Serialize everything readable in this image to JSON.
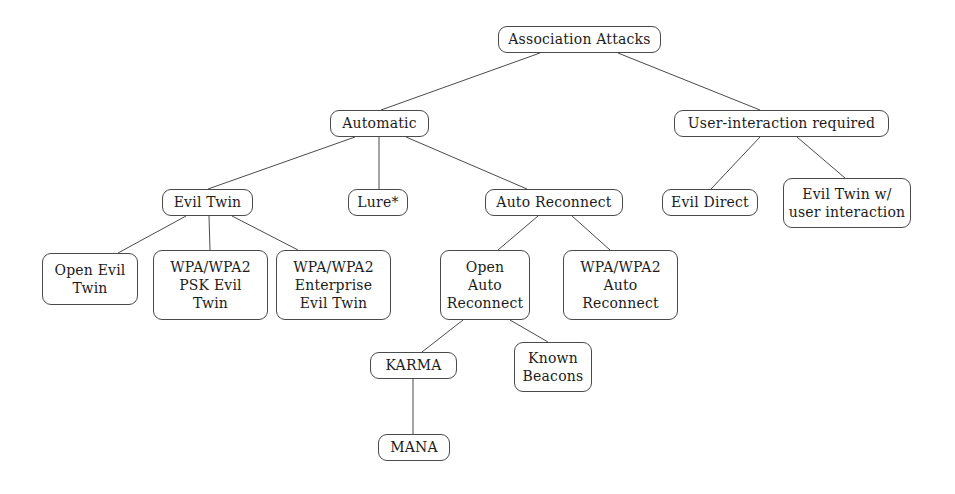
{
  "diagram": {
    "title": "Association Attacks",
    "type": "taxonomy-tree",
    "background_color": "#ffffff",
    "node_border_color": "#4a4a4a",
    "edge_color": "#4a4a4a",
    "text_color": "#1c1c1c",
    "footnote_marker": "*",
    "nodes": [
      {
        "id": "association-attacks",
        "lines": [
          "Association Attacks"
        ],
        "x": 498,
        "y": 26,
        "w": 163,
        "h": 27,
        "level": 0
      },
      {
        "id": "automatic",
        "lines": [
          "Automatic"
        ],
        "x": 330,
        "y": 110,
        "w": 99,
        "h": 27,
        "level": 1
      },
      {
        "id": "user-interaction-required",
        "lines": [
          "User-interaction required"
        ],
        "x": 674,
        "y": 110,
        "w": 215,
        "h": 27,
        "level": 1
      },
      {
        "id": "evil-twin",
        "lines": [
          "Evil Twin"
        ],
        "x": 162,
        "y": 189,
        "w": 91,
        "h": 27,
        "level": 2
      },
      {
        "id": "lure",
        "lines": [
          "Lure*"
        ],
        "x": 348,
        "y": 189,
        "w": 60,
        "h": 27,
        "level": 2
      },
      {
        "id": "auto-reconnect",
        "lines": [
          "Auto Reconnect"
        ],
        "x": 485,
        "y": 189,
        "w": 138,
        "h": 27,
        "level": 2
      },
      {
        "id": "evil-direct",
        "lines": [
          "Evil Direct"
        ],
        "x": 662,
        "y": 189,
        "w": 96,
        "h": 27,
        "level": 2
      },
      {
        "id": "evil-twin-with-user-interaction",
        "lines": [
          "Evil Twin w/",
          "user interaction"
        ],
        "x": 783,
        "y": 178,
        "w": 128,
        "h": 50,
        "level": 2
      },
      {
        "id": "open-evil-twin",
        "lines": [
          "Open Evil",
          "Twin"
        ],
        "x": 42,
        "y": 253,
        "w": 96,
        "h": 52,
        "level": 3
      },
      {
        "id": "wpa-wpa2-psk-evil-twin",
        "lines": [
          "WPA/WPA2",
          "PSK Evil",
          "Twin"
        ],
        "x": 153,
        "y": 250,
        "w": 115,
        "h": 70,
        "level": 3
      },
      {
        "id": "wpa-wpa2-enterprise-evil-twin",
        "lines": [
          "WPA/WPA2",
          "Enterprise",
          "Evil Twin"
        ],
        "x": 276,
        "y": 250,
        "w": 115,
        "h": 70,
        "level": 3
      },
      {
        "id": "open-auto-reconnect",
        "lines": [
          "Open",
          "Auto",
          "Reconnect"
        ],
        "x": 440,
        "y": 250,
        "w": 90,
        "h": 70,
        "level": 3
      },
      {
        "id": "wpa-wpa2-auto-reconnect",
        "lines": [
          "WPA/WPA2",
          "Auto",
          "Reconnect"
        ],
        "x": 563,
        "y": 250,
        "w": 115,
        "h": 70,
        "level": 3
      },
      {
        "id": "karma",
        "lines": [
          "KARMA"
        ],
        "x": 370,
        "y": 352,
        "w": 87,
        "h": 27,
        "level": 4
      },
      {
        "id": "known-beacons",
        "lines": [
          "Known",
          "Beacons"
        ],
        "x": 514,
        "y": 342,
        "w": 78,
        "h": 50,
        "level": 4
      },
      {
        "id": "mana",
        "lines": [
          "MANA"
        ],
        "x": 378,
        "y": 434,
        "w": 72,
        "h": 27,
        "level": 5
      }
    ],
    "edges": [
      {
        "id": "edge-root-automatic",
        "from": "association-attacks",
        "to": "automatic",
        "x1": 540,
        "y1": 53,
        "x2": 381,
        "y2": 110
      },
      {
        "id": "edge-root-user-interaction",
        "from": "association-attacks",
        "to": "user-interaction-required",
        "x1": 618,
        "y1": 53,
        "x2": 760,
        "y2": 110
      },
      {
        "id": "edge-automatic-evil-twin",
        "from": "automatic",
        "to": "evil-twin",
        "x1": 355,
        "y1": 137,
        "x2": 208,
        "y2": 189
      },
      {
        "id": "edge-automatic-lure",
        "from": "automatic",
        "to": "lure",
        "x1": 379,
        "y1": 137,
        "x2": 379,
        "y2": 189
      },
      {
        "id": "edge-automatic-auto-reconnect",
        "from": "automatic",
        "to": "auto-reconnect",
        "x1": 406,
        "y1": 137,
        "x2": 527,
        "y2": 189
      },
      {
        "id": "edge-user-interaction-evil-direct",
        "from": "user-interaction-required",
        "to": "evil-direct",
        "x1": 760,
        "y1": 137,
        "x2": 711,
        "y2": 189
      },
      {
        "id": "edge-user-interaction-evil-twin-w",
        "from": "user-interaction-required",
        "to": "evil-twin-with-user-interaction",
        "x1": 797,
        "y1": 137,
        "x2": 845,
        "y2": 178
      },
      {
        "id": "edge-evil-twin-open-evil-twin",
        "from": "evil-twin",
        "to": "open-evil-twin",
        "x1": 186,
        "y1": 216,
        "x2": 118,
        "y2": 253
      },
      {
        "id": "edge-evil-twin-psk",
        "from": "evil-twin",
        "to": "wpa-wpa2-psk-evil-twin",
        "x1": 209,
        "y1": 216,
        "x2": 210,
        "y2": 250
      },
      {
        "id": "edge-evil-twin-enterprise",
        "from": "evil-twin",
        "to": "wpa-wpa2-enterprise-evil-twin",
        "x1": 232,
        "y1": 216,
        "x2": 298,
        "y2": 250
      },
      {
        "id": "edge-auto-reconnect-open",
        "from": "auto-reconnect",
        "to": "open-auto-reconnect",
        "x1": 538,
        "y1": 216,
        "x2": 498,
        "y2": 250
      },
      {
        "id": "edge-auto-reconnect-wpa",
        "from": "auto-reconnect",
        "to": "wpa-wpa2-auto-reconnect",
        "x1": 572,
        "y1": 216,
        "x2": 610,
        "y2": 250
      },
      {
        "id": "edge-open-auto-reconnect-karma",
        "from": "open-auto-reconnect",
        "to": "karma",
        "x1": 463,
        "y1": 320,
        "x2": 422,
        "y2": 352
      },
      {
        "id": "edge-open-auto-reconnect-known-beacons",
        "from": "open-auto-reconnect",
        "to": "known-beacons",
        "x1": 510,
        "y1": 320,
        "x2": 548,
        "y2": 342
      },
      {
        "id": "edge-karma-mana",
        "from": "karma",
        "to": "mana",
        "x1": 413,
        "y1": 379,
        "x2": 413,
        "y2": 434
      }
    ]
  }
}
